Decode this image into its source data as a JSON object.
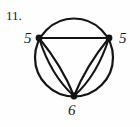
{
  "figure": {
    "problem_number": "11.",
    "type": "graph-diagram",
    "ink_color": "#141414",
    "background_color": "#fefefe",
    "vertices": [
      {
        "id": "left",
        "label": "5",
        "cx": 39,
        "cy": 38
      },
      {
        "id": "right",
        "label": "5",
        "cx": 109,
        "cy": 38
      },
      {
        "id": "bottom",
        "label": "6",
        "cx": 74,
        "cy": 96
      }
    ],
    "enclosing_circle": {
      "cx": 74,
      "cy": 57.5,
      "r": 39
    },
    "edges": [
      {
        "from": "left",
        "to": "right",
        "kind": "straight",
        "note": "top horizontal chord"
      },
      {
        "from": "left",
        "to": "right",
        "kind": "arc-top",
        "note": "circle upper arc"
      },
      {
        "from": "left",
        "to": "bottom",
        "kind": "arc-outer",
        "note": "circle lower-left arc"
      },
      {
        "from": "left",
        "to": "bottom",
        "kind": "curve-1",
        "note": "inner curve bulging left"
      },
      {
        "from": "left",
        "to": "bottom",
        "kind": "curve-2",
        "note": "inner curve bulging right"
      },
      {
        "from": "right",
        "to": "bottom",
        "kind": "arc-outer",
        "note": "circle lower-right arc"
      },
      {
        "from": "right",
        "to": "bottom",
        "kind": "curve-1",
        "note": "inner curve bulging right"
      },
      {
        "from": "right",
        "to": "bottom",
        "kind": "curve-2",
        "note": "inner curve bulging left"
      }
    ],
    "degrees": {
      "left": "5",
      "right": "5",
      "bottom": "6"
    }
  }
}
